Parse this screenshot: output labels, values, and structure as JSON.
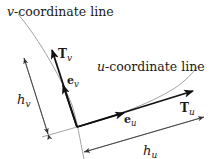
{
  "diagram": {
    "v_line_label": {
      "var": "v",
      "text": "-coordinate line"
    },
    "u_line_label": {
      "var": "u",
      "text": "-coordinate line"
    },
    "vectors": {
      "T_v": {
        "base": "T",
        "sub": "v"
      },
      "e_v": {
        "base": "e",
        "sub": "v"
      },
      "T_u": {
        "base": "T",
        "sub": "u"
      },
      "e_u": {
        "base": "e",
        "sub": "u"
      }
    },
    "dimensions": {
      "h_v": {
        "base": "h",
        "sub": "v"
      },
      "h_u": {
        "base": "h",
        "sub": "u"
      }
    },
    "colors": {
      "curve": "#999999",
      "vector": "#111111",
      "dimension": "#333333"
    }
  }
}
